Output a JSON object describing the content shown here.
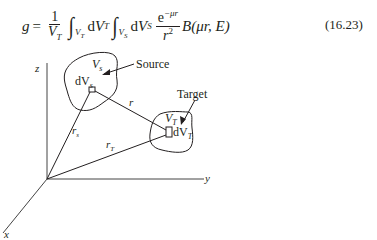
{
  "equation": {
    "lhs": "g",
    "equals": "=",
    "frac1_num": "1",
    "frac1_den": "V",
    "frac1_den_sub": "T",
    "int1_sub": "V",
    "int1_sub_sub": "T",
    "d1": "d",
    "v1": "V",
    "v1_sub": "T",
    "int2_sub": "V",
    "int2_sub_sub": "S",
    "d2": "d",
    "v2": "V",
    "v2_sub": "S",
    "frac2_num": "e",
    "frac2_num_sup": "−μr",
    "frac2_den": "r",
    "frac2_den_sup": "2",
    "func": "B",
    "func_args": "(μr, E)",
    "number": "(16.23)"
  },
  "diagram": {
    "axes": {
      "x": "x",
      "y": "y",
      "z": "z"
    },
    "source": {
      "label": "Source",
      "volume": "V",
      "volume_sub": "s",
      "element": "dV",
      "element_sub": "s"
    },
    "target": {
      "label": "Target",
      "volume": "V",
      "volume_sub": "T",
      "element": "dV",
      "element_sub": "T"
    },
    "vectors": {
      "r": "r",
      "rs": "r",
      "rs_sub": "s",
      "rT": "r",
      "rT_sub": "T"
    },
    "colors": {
      "line": "#231f20",
      "axis": "#555555"
    }
  }
}
